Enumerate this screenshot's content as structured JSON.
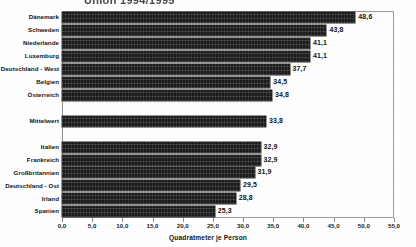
{
  "figure": {
    "title_partial": "Union 1994/1995",
    "title_clipped": true,
    "axis_title": "Quadratmeter je Person",
    "decimal_separator": ","
  },
  "chart_data": {
    "type": "bar",
    "orientation": "horizontal",
    "title": "Union 1994/1995",
    "xlabel": "Quadratmeter je Person",
    "ylabel": "",
    "xlim": [
      0.0,
      55.0
    ],
    "xticks": [
      0.0,
      5.0,
      10.0,
      15.0,
      20.0,
      25.0,
      30.0,
      35.0,
      40.0,
      45.0,
      50.0,
      55.0
    ],
    "xticklabels": [
      "0,0",
      "5,0",
      "10,0",
      "15,0",
      "20,0",
      "25,0",
      "30,0",
      "35,0",
      "40,0",
      "45,0",
      "50,0",
      "55,0"
    ],
    "grid": false,
    "legend": false,
    "bar_color": "#1b1b1b",
    "categories": [
      "Dänemark",
      "Schweden",
      "Niederlande",
      "Luxemburg",
      "Deutschland - West",
      "Belgien",
      "Österreich",
      "Mittelwert",
      "Italien",
      "Frankreich",
      "Großbritannien",
      "Deutschland - Ost",
      "Irland",
      "Spanien"
    ],
    "values": [
      48.6,
      43.8,
      41.1,
      41.1,
      37.7,
      34.5,
      34.8,
      33.8,
      32.9,
      32.9,
      31.9,
      29.5,
      28.8,
      25.3
    ],
    "value_labels": [
      "48,6",
      "43,8",
      "41,1",
      "41,1",
      "37,7",
      "34,5",
      "34,8",
      "33,8",
      "32,9",
      "32,9",
      "31,9",
      "29,5",
      "28,8",
      "25,3"
    ],
    "separated_category": "Mittelwert"
  },
  "bars": [
    {
      "label": "Dänemark",
      "value": 48.6,
      "value_label": "48,6",
      "slot": 0
    },
    {
      "label": "Schweden",
      "value": 43.8,
      "value_label": "43,8",
      "slot": 1
    },
    {
      "label": "Niederlande",
      "value": 41.1,
      "value_label": "41,1",
      "slot": 2
    },
    {
      "label": "Luxemburg",
      "value": 41.1,
      "value_label": "41,1",
      "slot": 3
    },
    {
      "label": "Deutschland - West",
      "value": 37.7,
      "value_label": "37,7",
      "slot": 4
    },
    {
      "label": "Belgien",
      "value": 34.5,
      "value_label": "34,5",
      "slot": 5
    },
    {
      "label": "Österreich",
      "value": 34.8,
      "value_label": "34,8",
      "slot": 6
    },
    {
      "label": "Mittelwert",
      "value": 33.8,
      "value_label": "33,8",
      "slot": 8
    },
    {
      "label": "Italien",
      "value": 32.9,
      "value_label": "32,9",
      "slot": 10
    },
    {
      "label": "Frankreich",
      "value": 32.9,
      "value_label": "32,9",
      "slot": 11
    },
    {
      "label": "Großbritannien",
      "value": 31.9,
      "value_label": "31,9",
      "slot": 12
    },
    {
      "label": "Deutschland - Ost",
      "value": 29.5,
      "value_label": "29,5",
      "slot": 13
    },
    {
      "label": "Irland",
      "value": 28.8,
      "value_label": "28,8",
      "slot": 14
    },
    {
      "label": "Spanien",
      "value": 25.3,
      "value_label": "25,3",
      "slot": 15
    }
  ]
}
